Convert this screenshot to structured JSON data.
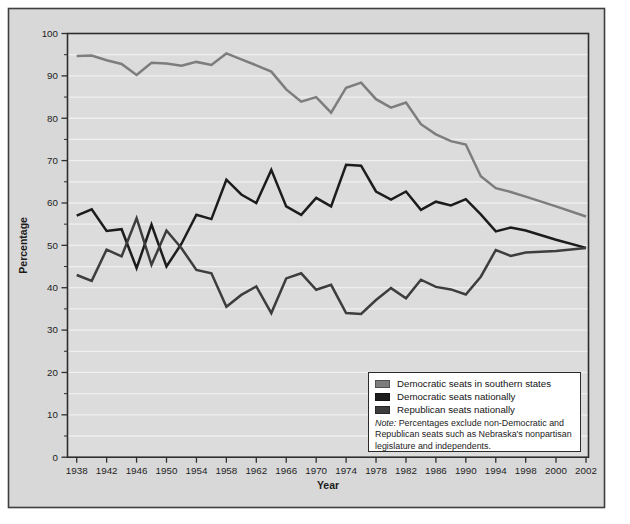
{
  "figure": {
    "background_color": "#d8d8d8",
    "plot_background_color": "#dcdcdc",
    "gridline_color": "#eef0ee",
    "axis_color": "#2e2e2e",
    "border_color": "#3f3f3f",
    "xlabel": "Year",
    "ylabel": "Percentage"
  },
  "legend": {
    "items": [
      {
        "label": "Democratic seats in southern states",
        "color": "#7d7d7d"
      },
      {
        "label": "Democratic seats nationally",
        "color": "#1c1c1c"
      },
      {
        "label": "Republican seats nationally",
        "color": "#3d3d3d"
      }
    ],
    "note_prefix": "Note:",
    "note_text": " Percentages exclude non-Democratic and Republican seats such as Nebraska's nonpartisan legislature and independents."
  },
  "chart_data": {
    "type": "line",
    "title": "",
    "xlabel": "Year",
    "ylabel": "Percentage",
    "ylim": [
      0,
      100
    ],
    "y_ticks": [
      0,
      10,
      20,
      30,
      40,
      50,
      60,
      70,
      80,
      90,
      100
    ],
    "grid": "horizontal lines every 5 units, no vertical gridlines",
    "legend_position": "lower right, inside plot",
    "x": [
      1938,
      1940,
      1942,
      1944,
      1946,
      1948,
      1950,
      1952,
      1954,
      1956,
      1958,
      1960,
      1962,
      1964,
      1966,
      1968,
      1970,
      1972,
      1974,
      1976,
      1978,
      1980,
      1982,
      1984,
      1986,
      1988,
      1990,
      1992,
      1994,
      1996,
      1998,
      2000,
      2002
    ],
    "x_tick_labels": [
      "1938",
      "1942",
      "1946",
      "1950",
      "1954",
      "1958",
      "1962",
      "1966",
      "1970",
      "1974",
      "1978",
      "1982",
      "1986",
      "1990",
      "1994",
      "1998",
      "2000",
      "2002"
    ],
    "series": [
      {
        "name": "Democratic seats in southern states",
        "color": "#7d7d7d",
        "values": [
          94.7,
          94.8,
          93.7,
          92.8,
          90.2,
          93.1,
          92.9,
          92.4,
          93.3,
          92.6,
          95.3,
          93.9,
          92.5,
          91.0,
          86.8,
          83.9,
          85.0,
          81.3,
          87.2,
          88.4,
          84.5,
          82.5,
          83.7,
          78.6,
          76.2,
          74.6,
          73.8,
          66.3,
          63.5,
          62.6,
          61.5,
          59.2,
          56.8
        ]
      },
      {
        "name": "Democratic seats nationally",
        "color": "#1c1c1c",
        "values": [
          57.0,
          58.5,
          53.4,
          53.8,
          44.6,
          54.9,
          45.0,
          50.4,
          57.2,
          56.2,
          65.5,
          62.0,
          60.0,
          67.8,
          59.2,
          57.2,
          61.2,
          59.2,
          69.0,
          68.8,
          62.7,
          60.8,
          62.7,
          58.4,
          60.3,
          59.4,
          60.9,
          57.3,
          53.3,
          54.2,
          53.5,
          51.3,
          49.4
        ]
      },
      {
        "name": "Republican seats nationally",
        "color": "#3d3d3d",
        "values": [
          43.0,
          41.6,
          49.0,
          47.4,
          56.4,
          45.4,
          53.5,
          49.3,
          44.2,
          43.4,
          35.5,
          38.3,
          40.3,
          34.0,
          42.2,
          43.4,
          39.5,
          40.7,
          34.0,
          33.8,
          37.1,
          39.9,
          37.5,
          41.9,
          40.2,
          39.6,
          38.4,
          42.6,
          48.9,
          47.5,
          48.3,
          48.7,
          49.4
        ]
      }
    ]
  }
}
